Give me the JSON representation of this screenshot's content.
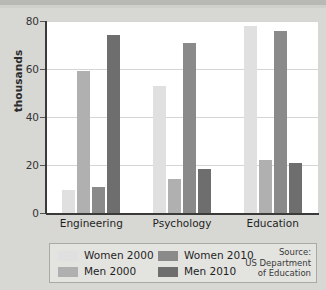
{
  "chart_data": {
    "type": "bar",
    "title": "",
    "xlabel": "",
    "ylabel": "thousands",
    "ylim": [
      0,
      80
    ],
    "yticks": [
      0,
      20,
      40,
      60,
      80
    ],
    "grid": true,
    "legend_position": "bottom",
    "categories": [
      "Engineering",
      "Psychology",
      "Education"
    ],
    "series": [
      {
        "name": "Women 2000",
        "color": "#e0e0e0",
        "values": [
          9.5,
          53,
          78
        ]
      },
      {
        "name": "Men 2000",
        "color": "#b0b0b0",
        "values": [
          59,
          14,
          22
        ]
      },
      {
        "name": "Women 2010",
        "color": "#8a8a8a",
        "values": [
          11,
          71,
          76
        ]
      },
      {
        "name": "Men 2010",
        "color": "#6e6e6e",
        "values": [
          74,
          18.5,
          21
        ]
      }
    ],
    "annotations": {
      "source_line1": "Source:",
      "source_line2": "US Department",
      "source_line3": "of Education"
    }
  },
  "axis": {
    "y_tick_labels": [
      "80",
      "60",
      "40",
      "20",
      "0"
    ],
    "y_axis_title": "thousands"
  },
  "legend": {
    "items": [
      {
        "label": "Women 2000"
      },
      {
        "label": "Men 2000"
      },
      {
        "label": "Women 2010"
      },
      {
        "label": "Men 2010"
      }
    ]
  },
  "colors": {
    "background": "#d7d7d3",
    "plot_background": "#ffffff",
    "axis": "#3a3a3a",
    "gridline": "#d5d5d5",
    "legend_background": "#e3e3df",
    "legend_border": "#a9a9a5"
  }
}
